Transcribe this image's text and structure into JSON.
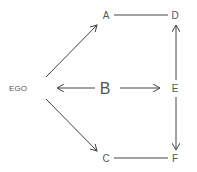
{
  "diagram": {
    "type": "directed-graph",
    "colors": {
      "line": "#444444",
      "text": "#555555",
      "background": "#ffffff"
    },
    "nodes": [
      {
        "id": "EGO",
        "label": "EGO",
        "x": 18,
        "y": 88,
        "size": 8
      },
      {
        "id": "A",
        "label": "A",
        "x": 106,
        "y": 15,
        "size": 10
      },
      {
        "id": "B",
        "label": "B",
        "x": 105,
        "y": 88,
        "size": 16
      },
      {
        "id": "C",
        "label": "C",
        "x": 106,
        "y": 158,
        "size": 10
      },
      {
        "id": "D",
        "label": "D",
        "x": 175,
        "y": 15,
        "size": 10
      },
      {
        "id": "E",
        "label": "E",
        "x": 175,
        "y": 88,
        "size": 10
      },
      {
        "id": "F",
        "label": "F",
        "x": 175,
        "y": 158,
        "size": 10
      }
    ],
    "edges": [
      {
        "from": "EGO",
        "to": "A",
        "directed": true,
        "x1": 46,
        "y1": 77,
        "x2": 97,
        "y2": 25
      },
      {
        "from": "EGO",
        "to": "C",
        "directed": true,
        "x1": 46,
        "y1": 99,
        "x2": 97,
        "y2": 151
      },
      {
        "from": "B",
        "to": "EGO",
        "directed": true,
        "x1": 95,
        "y1": 88,
        "x2": 57,
        "y2": 88
      },
      {
        "from": "B",
        "to": "E",
        "directed": true,
        "x1": 120,
        "y1": 88,
        "x2": 160,
        "y2": 88
      },
      {
        "from": "A",
        "to": "D",
        "directed": false,
        "x1": 114,
        "y1": 15,
        "x2": 168,
        "y2": 15
      },
      {
        "from": "C",
        "to": "F",
        "directed": false,
        "x1": 114,
        "y1": 158,
        "x2": 168,
        "y2": 158
      },
      {
        "from": "E",
        "to": "D",
        "directed": true,
        "x1": 176,
        "y1": 80,
        "x2": 176,
        "y2": 25
      },
      {
        "from": "E",
        "to": "F",
        "directed": true,
        "x1": 176,
        "y1": 97,
        "x2": 176,
        "y2": 150
      }
    ]
  }
}
